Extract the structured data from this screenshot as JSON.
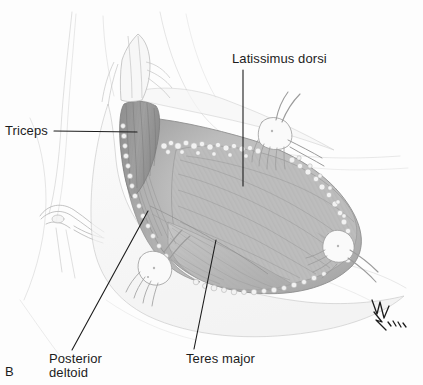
{
  "figure": {
    "panel_letter": "B",
    "background_color": "#fdfdfd",
    "ink_color": "#1c1c1c",
    "medium": "pencil-and-wash anatomical illustration",
    "signature": "artist-monogram-2002"
  },
  "labels": {
    "triceps": "Triceps",
    "latissimus_dorsi": "Latissimus dorsi",
    "teres_major": "Teres major",
    "posterior_deltoid_line1": "Posterior",
    "posterior_deltoid_line2": "deltoid"
  },
  "leader_lines": [
    {
      "name": "triceps-leader",
      "from": [
        54,
        131
      ],
      "to": [
        137,
        132
      ]
    },
    {
      "name": "latissimus-leader",
      "from": [
        243,
        70
      ],
      "to": [
        243,
        186
      ]
    },
    {
      "name": "teres-major-leader",
      "from": [
        194,
        349
      ],
      "to": [
        216,
        240
      ]
    },
    {
      "name": "deltoid-leader",
      "from": [
        72,
        350
      ],
      "to": [
        148,
        211
      ]
    }
  ],
  "anatomy": {
    "structures": [
      {
        "name": "triceps",
        "tone": "#9a9a9a",
        "note": "dark striated muscle belly, upper left of wound"
      },
      {
        "name": "latissimus-dorsi",
        "tone": "#b6b6b6",
        "note": "broad fan of fibers filling centre and right of wound"
      },
      {
        "name": "teres-major",
        "tone": "#c2c2c2",
        "note": "lower-central muscle band below latissimus"
      },
      {
        "name": "posterior-deltoid",
        "tone": "#ababab",
        "note": "muscle along the left wound margin"
      },
      {
        "name": "subcutaneous-fat",
        "tone": "#eeeeee",
        "note": "scalloped bubbly layer along wound edges"
      },
      {
        "name": "skin-margin",
        "tone": "#f4f4f4",
        "note": "retracted skin flaps surrounding the exposure"
      },
      {
        "name": "arm-contour",
        "tone": "#f7f7f7",
        "note": "faint outline of upper arm at left"
      },
      {
        "name": "torso-contour",
        "tone": "#f7f7f7",
        "note": "faint outline of trunk at upper right"
      }
    ],
    "instruments": [
      {
        "name": "rake-retractor-superior",
        "position": [
          272,
          135
        ],
        "prongs": 5
      },
      {
        "name": "rake-retractor-lateral",
        "position": [
          336,
          252
        ],
        "prongs": 4
      },
      {
        "name": "rake-retractor-inferior",
        "position": [
          150,
          278
        ],
        "prongs": 4
      }
    ]
  }
}
